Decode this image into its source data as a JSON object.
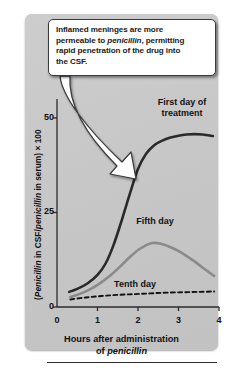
{
  "callout": {
    "line1_a": "Inflamed meninges are more",
    "line2_a": "permeable to ",
    "line2_i": "penicillin",
    "line2_b": ", permitting",
    "line3_a": "rapid penetration of the drug into",
    "line4_a": "the CSF."
  },
  "axes": {
    "y_title_a": "(",
    "y_title_i1": "Penicillin",
    "y_title_b": " in CSF/",
    "y_title_i2": "penicillin",
    "y_title_c": " in serum) × 100",
    "x_title_line1": "Hours after administration",
    "x_title_line2_a": "of ",
    "x_title_line2_i": "penicillin"
  },
  "chart_data": {
    "type": "line",
    "xlabel": "Hours after administration of penicillin",
    "ylabel": "(Penicillin in CSF/penicillin in serum) × 100",
    "xlim": [
      0,
      4
    ],
    "ylim": [
      0,
      55
    ],
    "xticks": [
      0,
      1,
      2,
      3,
      4
    ],
    "xtick_labels": [
      "0",
      "1",
      "2",
      "3",
      "4"
    ],
    "yticks": [
      0,
      25,
      50
    ],
    "ytick_labels": [
      "0",
      "25",
      "50"
    ],
    "grid": false,
    "legend": "inline-curve-labels",
    "series": [
      {
        "name": "First day of treatment",
        "label_line1": "First day of",
        "label_line2": "treatment",
        "color": "#2a2a2a",
        "style": "solid",
        "width": 2.6,
        "x": [
          0.3,
          0.5,
          0.75,
          1.0,
          1.2,
          1.4,
          1.6,
          1.8,
          2.0,
          2.2,
          2.4,
          2.6,
          2.8,
          3.0,
          3.2,
          3.4,
          3.6,
          3.85
        ],
        "y": [
          4.0,
          4.8,
          6.2,
          8.5,
          11.5,
          16.5,
          23.0,
          30.0,
          36.5,
          40.5,
          42.8,
          44.0,
          44.8,
          45.3,
          45.6,
          45.7,
          45.6,
          45.2
        ]
      },
      {
        "name": "Fifth day",
        "label_line1": "Fifth day",
        "color": "#8a8a8a",
        "style": "solid",
        "width": 2.6,
        "x": [
          0.33,
          0.55,
          0.8,
          1.05,
          1.3,
          1.55,
          1.8,
          2.05,
          2.35,
          2.6,
          2.85,
          3.1,
          3.35,
          3.6,
          3.88
        ],
        "y": [
          2.6,
          3.4,
          4.6,
          6.2,
          8.2,
          10.6,
          13.2,
          15.4,
          16.9,
          16.6,
          15.6,
          14.2,
          12.4,
          10.4,
          8.2
        ]
      },
      {
        "name": "Tenth day",
        "label_line1": "Tenth day",
        "color": "#111111",
        "style": "dashed",
        "width": 1.9,
        "x": [
          0.33,
          0.7,
          1.1,
          1.5,
          1.9,
          2.3,
          2.7,
          3.1,
          3.5,
          3.88
        ],
        "y": [
          2.0,
          2.5,
          2.9,
          3.2,
          3.4,
          3.6,
          3.8,
          3.9,
          4.0,
          4.1
        ]
      }
    ],
    "annotation": {
      "text": "Inflamed meninges are more permeable to penicillin, permitting rapid penetration of the drug into the CSF.",
      "points_to_x": 2.0,
      "points_to_y": 37
    }
  }
}
